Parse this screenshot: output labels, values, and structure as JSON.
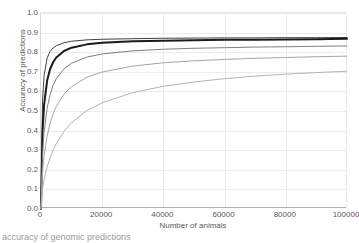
{
  "chart_data": {
    "type": "line",
    "title": "",
    "xlabel": "Number of animals",
    "ylabel": "Accuracy of predictions",
    "xlim": [
      0,
      100000
    ],
    "ylim": [
      0.0,
      1.0
    ],
    "xticks": [
      0,
      20000,
      40000,
      60000,
      80000,
      100000
    ],
    "xtick_labels": [
      "0",
      "20000",
      "40000",
      "60000",
      "80000",
      "100000"
    ],
    "yticks": [
      0.0,
      0.1,
      0.2,
      0.3,
      0.4,
      0.5,
      0.6,
      0.7,
      0.8,
      0.9,
      1.0
    ],
    "ytick_labels": [
      "0.0",
      "0.1",
      "0.2",
      "0.3",
      "0.4",
      "0.5",
      "0.6",
      "0.7",
      "0.8",
      "0.9",
      "1.0"
    ],
    "grid": true,
    "legend": "none",
    "x": [
      0,
      500,
      1000,
      2000,
      3000,
      4000,
      5000,
      7500,
      10000,
      15000,
      20000,
      30000,
      40000,
      50000,
      60000,
      70000,
      80000,
      90000,
      100000
    ],
    "series": [
      {
        "name": "series-1",
        "color": "#404040",
        "width": 1.0,
        "plateau": 0.875,
        "values": [
          0.0,
          0.55,
          0.68,
          0.77,
          0.805,
          0.822,
          0.833,
          0.848,
          0.856,
          0.863,
          0.866,
          0.869,
          0.871,
          0.872,
          0.873,
          0.873,
          0.874,
          0.874,
          0.875
        ]
      },
      {
        "name": "series-2",
        "color": "#1a1a1a",
        "width": 2.0,
        "plateau": 0.868,
        "values": [
          0.0,
          0.4,
          0.53,
          0.655,
          0.715,
          0.75,
          0.773,
          0.806,
          0.823,
          0.84,
          0.848,
          0.856,
          0.859,
          0.861,
          0.863,
          0.864,
          0.865,
          0.866,
          0.868
        ]
      },
      {
        "name": "series-3",
        "color": "#808080",
        "width": 1.0,
        "plateau": 0.832,
        "values": [
          0.0,
          0.28,
          0.39,
          0.515,
          0.585,
          0.632,
          0.665,
          0.715,
          0.744,
          0.775,
          0.791,
          0.807,
          0.815,
          0.82,
          0.823,
          0.826,
          0.828,
          0.83,
          0.832
        ]
      },
      {
        "name": "series-4",
        "color": "#a6a6a6",
        "width": 1.0,
        "plateau": 0.805,
        "values": [
          0.0,
          0.19,
          0.27,
          0.372,
          0.438,
          0.487,
          0.524,
          0.586,
          0.625,
          0.672,
          0.699,
          0.729,
          0.746,
          0.756,
          0.763,
          0.769,
          0.773,
          0.777,
          0.78
        ]
      },
      {
        "name": "series-5",
        "color": "#b3b3b3",
        "width": 1.0,
        "plateau": 0.745,
        "values": [
          0.0,
          0.1,
          0.15,
          0.215,
          0.263,
          0.302,
          0.334,
          0.396,
          0.441,
          0.502,
          0.542,
          0.594,
          0.626,
          0.648,
          0.665,
          0.678,
          0.688,
          0.696,
          0.703
        ]
      }
    ]
  },
  "axes": {
    "y_title": "Accuracy of predictions",
    "x_title": "Number of animals"
  },
  "caption": {
    "text": "accuracy of genomic predictions"
  }
}
